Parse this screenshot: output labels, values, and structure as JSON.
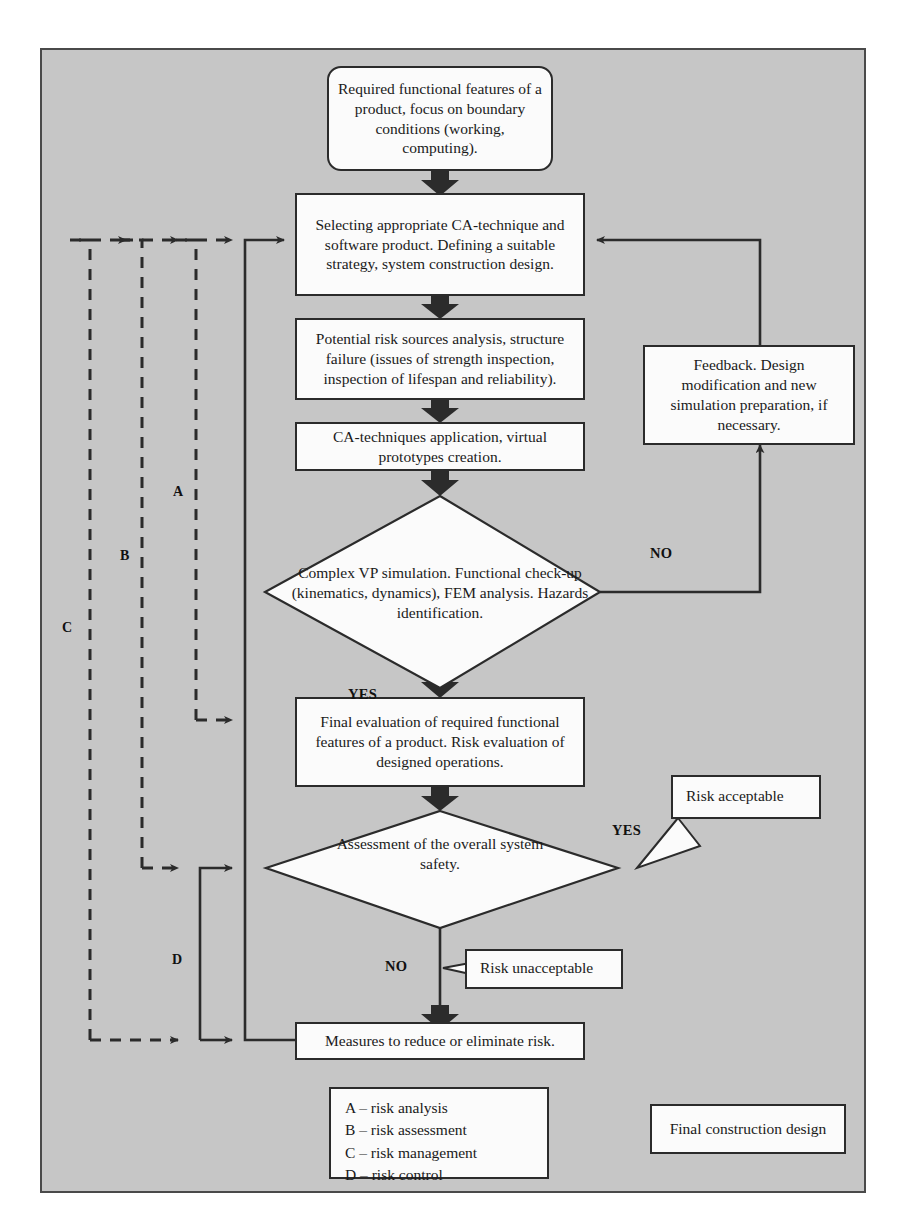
{
  "diagram": {
    "background_color": "#c6c6c6",
    "node_fill": "#fbfbfb",
    "line_color": "#2b2b2b"
  },
  "nodes": {
    "start": "Required functional features of a product, focus on boundary conditions (working, computing).",
    "selecting": "Selecting appropriate CA-technique and software product. Defining a suitable strategy, system construction design.",
    "risk_sources": "Potential risk sources analysis, structure failure (issues of strength inspection, inspection of lifespan and reliability).",
    "ca_application": "CA-techniques application, virtual prototypes creation.",
    "simulation_decision": "Complex VP simulation. Functional check-up (kinematics, dynamics), FEM analysis. Hazards identification.",
    "feedback": "Feedback. Design modification and new simulation preparation, if necessary.",
    "final_evaluation": "Final evaluation of required functional features of a product. Risk evaluation of designed operations.",
    "assessment_decision": "Assessment of the overall system safety.",
    "measures": "Measures to reduce or eliminate risk.",
    "final_design": "Final construction design"
  },
  "callouts": {
    "risk_acceptable": "Risk acceptable",
    "risk_unacceptable": "Risk unacceptable"
  },
  "edge_labels": {
    "simulation_no": "NO",
    "simulation_yes": "YES",
    "assessment_yes": "YES",
    "assessment_no": "NO"
  },
  "branch_labels": {
    "a": "A",
    "b": "B",
    "c": "C",
    "d": "D"
  },
  "legend": {
    "items": [
      "A – risk analysis",
      "B – risk assessment",
      "C – risk management",
      "D – risk control"
    ],
    "line_a": "A – risk analysis",
    "line_b": "B – risk assessment",
    "line_c": "C – risk management",
    "line_d": "D – risk control"
  }
}
